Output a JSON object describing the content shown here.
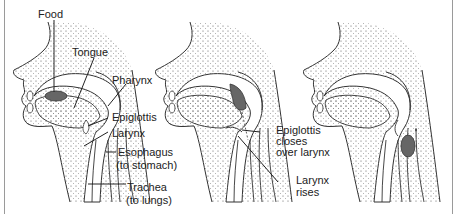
{
  "figure": {
    "panels": [
      {
        "id": "panel-1",
        "labels": {
          "food": "Food",
          "tongue": "Tongue",
          "pharynx": "Pharynx",
          "epiglottis": "Epiglottis",
          "larynx": "Larynx",
          "esophagus": "Esophagus",
          "esophagus_note": "(to stomach)",
          "trachea": "Trachea",
          "trachea_note": "(to lungs)"
        }
      },
      {
        "id": "panel-2",
        "labels": {
          "epiglottis_line1": "Epiglottis",
          "epiglottis_line2": "closes",
          "epiglottis_line3": "over larynx",
          "larynx_line1": "Larynx",
          "larynx_line2": "rises"
        }
      },
      {
        "id": "panel-3",
        "labels": {}
      }
    ],
    "colors": {
      "line": "#333333",
      "stipple": "#555555",
      "food_bolus": "#666666",
      "border": "#9a9a9a"
    }
  }
}
